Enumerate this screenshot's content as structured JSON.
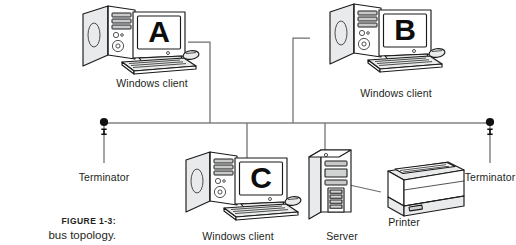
{
  "figure": {
    "caption_number": "FIGURE 1-3:",
    "caption_text": "bus topology."
  },
  "colors": {
    "ink": "#231f20",
    "line": "#6d6e71",
    "bus_line": "#808285",
    "device_outline": "#1a1a1a",
    "device_fill": "#ffffff",
    "shade": "#e6e7e8",
    "terminator_dot": "#111111",
    "background": "#ffffff"
  },
  "diagram": {
    "type": "network-topology",
    "topology": "bus",
    "bus": {
      "label": "bus-backbone",
      "y": 123,
      "x_start": 104,
      "x_end": 490
    },
    "terminators": [
      {
        "id": "terminator-left",
        "label": "Terminator",
        "x": 104,
        "y": 123,
        "label_x": 104,
        "label_y": 172
      },
      {
        "id": "terminator-right",
        "label": "Terminator",
        "x": 490,
        "y": 123,
        "label_x": 490,
        "label_y": 172
      }
    ],
    "nodes": [
      {
        "id": "client-a",
        "kind": "desktop-computer",
        "screen_letter": "A",
        "label": "Windows client",
        "label_x": 152,
        "label_y": 78,
        "drop_x": 210,
        "tap_y": 42
      },
      {
        "id": "client-b",
        "kind": "desktop-computer",
        "screen_letter": "B",
        "label": "Windows client",
        "label_x": 396,
        "label_y": 88,
        "drop_x": 293,
        "tap_y": 38
      },
      {
        "id": "client-c",
        "kind": "desktop-computer",
        "screen_letter": "C",
        "label": "Windows client",
        "label_x": 238,
        "label_y": 231,
        "drop_x": 247,
        "tap_y": 160
      },
      {
        "id": "server",
        "kind": "server-tower",
        "screen_letter": "",
        "label": "Server",
        "label_x": 342,
        "label_y": 231,
        "drop_x": 325,
        "tap_y": 148
      },
      {
        "id": "printer",
        "kind": "laser-printer",
        "screen_letter": "",
        "label": "Printer",
        "label_x": 404,
        "label_y": 217,
        "drop_x": null,
        "tap_y": null
      }
    ],
    "connections": [
      {
        "from": "client-a",
        "to": "bus-backbone",
        "style": "orthogonal-drop"
      },
      {
        "from": "client-b",
        "to": "bus-backbone",
        "style": "orthogonal-drop"
      },
      {
        "from": "client-c",
        "to": "bus-backbone",
        "style": "vertical-drop"
      },
      {
        "from": "server",
        "to": "bus-backbone",
        "style": "vertical-drop"
      },
      {
        "from": "server",
        "to": "printer",
        "style": "direct-cable"
      }
    ]
  }
}
